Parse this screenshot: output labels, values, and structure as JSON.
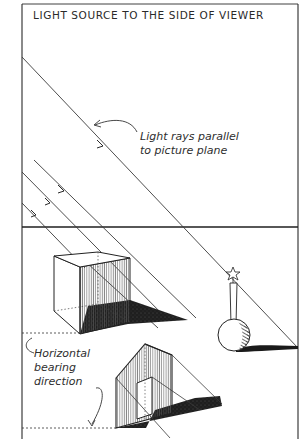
{
  "title": "LIGHT SOURCE TO THE SIDE OF VIEWER",
  "annotations": {
    "light_rays": [
      "Light rays parallel",
      "to picture plane"
    ],
    "bearing": [
      "Horizontal",
      "bearing",
      "direction"
    ]
  },
  "colors": {
    "ink": "#2a2a2a",
    "shadow": "#1e1e1e",
    "paper": "#ffffff",
    "hatch": "#6a6a6a"
  },
  "objects": [
    "cube",
    "house",
    "vase-with-flower"
  ],
  "elements": {
    "frame": "picture-plane-frame",
    "horizon": "horizon-line",
    "rays": [
      "light-ray-1",
      "light-ray-2",
      "light-ray-3",
      "light-ray-4",
      "light-ray-5"
    ]
  }
}
